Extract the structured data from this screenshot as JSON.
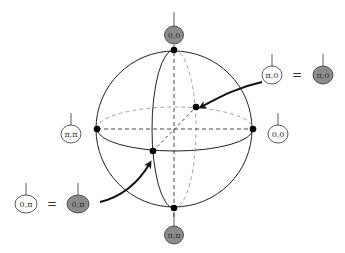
{
  "diagram": {
    "type": "sphere-state-diagram",
    "sphere": {
      "cx": 174,
      "cy": 129,
      "r": 78
    },
    "colors": {
      "stroke": "#222222",
      "dashed": "#9a9a9a",
      "filled_node": "#8c8c8c",
      "open_node": "#ffffff",
      "point": "#000000"
    },
    "nodes": {
      "top": {
        "label": "0,0",
        "filled": true
      },
      "bottom": {
        "label": "π,π",
        "filled": true
      },
      "left": {
        "label": "π,π",
        "filled": false
      },
      "right": {
        "label": "0,0",
        "filled": false
      },
      "back_open": {
        "label": "π,0",
        "filled": false
      },
      "back_filled": {
        "label": "π,0",
        "filled": true
      },
      "front_open": {
        "label": "0,π",
        "filled": false
      },
      "front_filled": {
        "label": "0,π",
        "filled": true
      }
    },
    "equals_sign": "=",
    "points": [
      {
        "name": "north-pole",
        "x": 174,
        "y": 50
      },
      {
        "name": "south-pole",
        "x": 174,
        "y": 208
      },
      {
        "name": "west-point",
        "x": 97,
        "y": 129
      },
      {
        "name": "east-point",
        "x": 253,
        "y": 129
      },
      {
        "name": "back-point",
        "x": 196,
        "y": 107
      },
      {
        "name": "front-point",
        "x": 153,
        "y": 151
      }
    ]
  }
}
